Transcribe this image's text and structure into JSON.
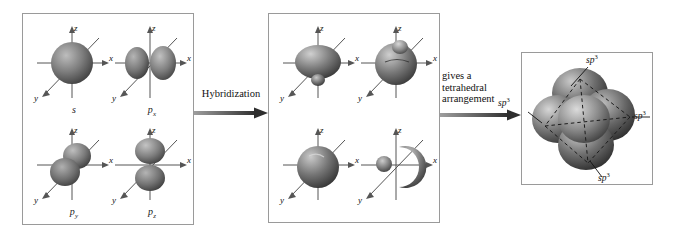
{
  "diagram": {
    "background": "#ffffff",
    "border_color": "#9a9a9a",
    "axis_color": "#4d4d4d",
    "orbital_dark": "#4a4a4a",
    "orbital_mid": "#8c8c8c",
    "orbital_light": "#d8d8d8",
    "arrow_color": "#555555"
  },
  "panels": {
    "atomic": {
      "name": "atomic-orbitals-panel",
      "orbitals": [
        {
          "label": "s",
          "sub": "",
          "kind": "s",
          "axes": {
            "z": "z",
            "x": "x",
            "y": "y"
          }
        },
        {
          "label": "p",
          "sub": "x",
          "kind": "px",
          "axes": {
            "z": "z",
            "x": "x",
            "y": "y"
          }
        },
        {
          "label": "p",
          "sub": "y",
          "kind": "py",
          "axes": {
            "z": "z",
            "x": "x",
            "y": "y"
          }
        },
        {
          "label": "p",
          "sub": "z",
          "kind": "pz",
          "axes": {
            "z": "z",
            "x": "x",
            "y": "y"
          }
        }
      ]
    },
    "hybrid": {
      "name": "hybrid-orbitals-panel",
      "orbitals": [
        {
          "label": "",
          "sub": "",
          "kind": "hybrid-1",
          "axes": {
            "z": "z",
            "x": "x",
            "y": "y"
          }
        },
        {
          "label": "",
          "sub": "",
          "kind": "hybrid-2",
          "axes": {
            "z": "z",
            "x": "x",
            "y": "y"
          }
        },
        {
          "label": "",
          "sub": "",
          "kind": "hybrid-3",
          "axes": {
            "z": "z",
            "x": "x",
            "y": "y"
          }
        },
        {
          "label": "",
          "sub": "",
          "kind": "hybrid-4",
          "axes": {
            "z": "z",
            "x": "x",
            "y": "y"
          }
        }
      ]
    },
    "tetrahedral": {
      "name": "tetrahedral-arrangement-panel",
      "lobe_labels": [
        {
          "text": "sp",
          "sup": "3",
          "position": "top"
        },
        {
          "text": "sp",
          "sup": "3",
          "position": "left"
        },
        {
          "text": "sp",
          "sup": "3",
          "position": "right"
        },
        {
          "text": "sp",
          "sup": "3",
          "position": "bottom"
        }
      ]
    }
  },
  "arrows": [
    {
      "name": "hybridization-arrow",
      "label": "Hybridization"
    },
    {
      "name": "tetrahedral-arrow",
      "label": "gives a\ntetrahedral\narrangement"
    }
  ]
}
